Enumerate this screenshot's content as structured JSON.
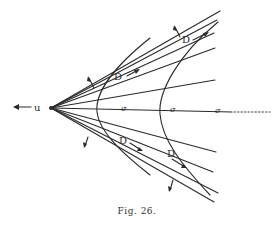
{
  "figure": {
    "caption": "Fig. 26.",
    "labels": {
      "velocity": "u",
      "sigma": "σ",
      "wave": "D"
    },
    "colors": {
      "ink": "#2a2a2a",
      "background": "#ffffff"
    },
    "vertex": [
      51,
      108
    ],
    "rays_upper": [
      [
        220,
        11
      ],
      [
        217,
        20
      ],
      [
        214,
        33
      ],
      [
        215,
        48
      ],
      [
        215,
        80
      ]
    ],
    "ray_axis": [
      232,
      112
    ],
    "ray_axis_dotted_end": [
      270,
      112
    ],
    "rays_lower": [
      [
        216,
        152
      ],
      [
        213,
        172
      ],
      [
        218,
        193
      ],
      [
        214,
        202
      ]
    ]
  }
}
